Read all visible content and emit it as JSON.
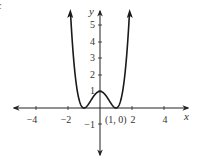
{
  "chart_data": {
    "type": "line",
    "title": "",
    "function": "y = (x^2 - 1)^2",
    "xlabel": "x",
    "ylabel": "y",
    "xlim": [
      -5.5,
      5.5
    ],
    "ylim": [
      -2.8,
      6
    ],
    "x_ticks": [
      -4,
      -2,
      2,
      4
    ],
    "x_tick_labels": [
      "−4",
      "−2",
      "2",
      "4"
    ],
    "y_ticks": [
      -1,
      1,
      2,
      3,
      4,
      5
    ],
    "y_tick_labels": [
      "−1",
      "1",
      "2",
      "3",
      "4",
      "5"
    ],
    "grid": false,
    "legend": null,
    "annotations": [
      {
        "text": "(1, 0)",
        "x": 1,
        "y": 0
      }
    ],
    "series": [
      {
        "name": "f(x)",
        "x": [
          -1.6,
          -1.4,
          -1.2,
          -1.0,
          -0.8,
          -0.6,
          -0.4,
          -0.2,
          0,
          0.2,
          0.4,
          0.6,
          0.8,
          1.0,
          1.2,
          1.4,
          1.6
        ],
        "values": [
          2.43,
          0.92,
          0.19,
          0,
          0.13,
          0.41,
          0.71,
          0.92,
          1,
          0.92,
          0.71,
          0.41,
          0.13,
          0,
          0.19,
          0.92,
          2.43
        ]
      }
    ],
    "key_points": [
      {
        "label": "local max",
        "x": 0,
        "y": 1
      },
      {
        "label": "min",
        "x": -1,
        "y": 0
      },
      {
        "label": "min",
        "x": 1,
        "y": 0
      }
    ]
  },
  "labels": {
    "x_axis": "x",
    "y_axis": "y",
    "point_label": "(1, 0)",
    "corner_mark": "c"
  }
}
